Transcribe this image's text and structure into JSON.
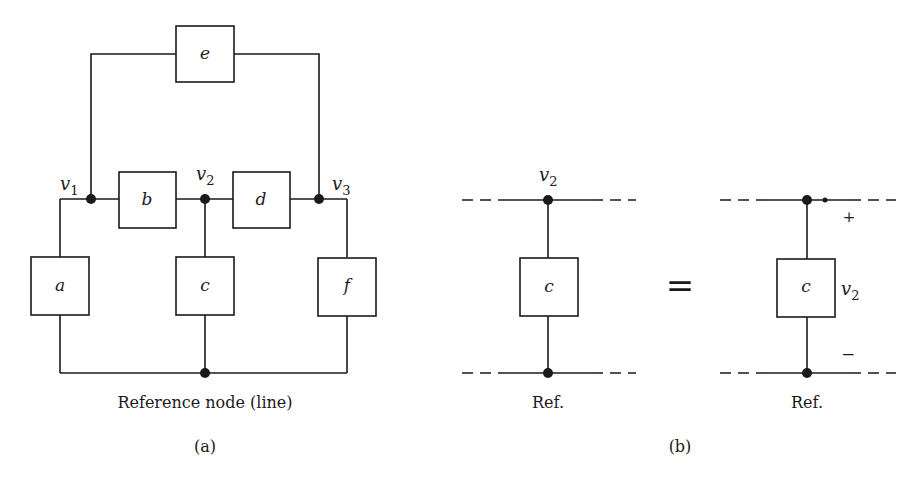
{
  "figure": {
    "panel_a": {
      "label": "(a)",
      "caption": "Reference node (line)",
      "elements": [
        {
          "id": "a",
          "label": "a"
        },
        {
          "id": "b",
          "label": "b"
        },
        {
          "id": "c",
          "label": "c"
        },
        {
          "id": "d",
          "label": "d"
        },
        {
          "id": "e",
          "label": "e"
        },
        {
          "id": "f",
          "label": "f"
        }
      ],
      "nodes": [
        {
          "name": "v",
          "sub": "1"
        },
        {
          "name": "v",
          "sub": "2"
        },
        {
          "name": "v",
          "sub": "3"
        }
      ]
    },
    "panel_b": {
      "label": "(b)",
      "left": {
        "node_name": "v",
        "node_sub": "2",
        "element_label": "c",
        "ref_label": "Ref."
      },
      "equals": "=",
      "right": {
        "element_label": "c",
        "voltage_name": "v",
        "voltage_sub": "2",
        "plus": "+",
        "minus": "−",
        "ref_label": "Ref."
      }
    }
  }
}
